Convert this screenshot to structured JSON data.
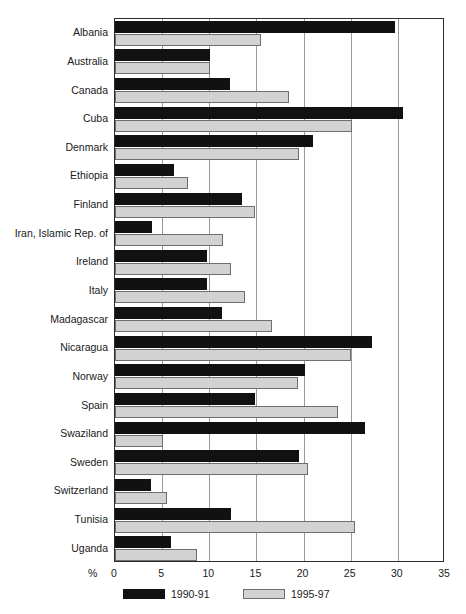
{
  "chart_data": {
    "type": "bar",
    "orientation": "horizontal",
    "title": "",
    "xlabel": "%",
    "ylabel": "",
    "xlim": [
      0,
      35
    ],
    "xticks": [
      0,
      5,
      10,
      15,
      20,
      25,
      30,
      35
    ],
    "grid": true,
    "legend_position": "bottom",
    "categories": [
      "Albania",
      "Australia",
      "Canada",
      "Cuba",
      "Denmark",
      "Ethiopia",
      "Finland",
      "Iran, Islamic Rep. of",
      "Ireland",
      "Italy",
      "Madagascar",
      "Nicaragua",
      "Norway",
      "Spain",
      "Swaziland",
      "Sweden",
      "Switzerland",
      "Tunisia",
      "Uganda"
    ],
    "series": [
      {
        "name": "1990-91",
        "color": "#111111",
        "values": [
          29.7,
          10.1,
          12.2,
          30.5,
          21.0,
          6.3,
          13.5,
          3.9,
          9.8,
          9.8,
          11.3,
          27.3,
          20.2,
          14.8,
          26.5,
          19.5,
          3.8,
          12.3,
          5.9
        ]
      },
      {
        "name": "1995-97",
        "color": "#d2d2d2",
        "values": [
          15.5,
          10.1,
          18.5,
          25.1,
          19.5,
          7.7,
          14.8,
          11.5,
          12.3,
          13.8,
          16.6,
          25.0,
          19.4,
          23.7,
          5.1,
          20.5,
          5.5,
          25.5,
          8.7
        ]
      }
    ]
  },
  "legend": {
    "items": [
      {
        "label": "1990-91"
      },
      {
        "label": "1995-97"
      }
    ]
  },
  "axis": {
    "percent_symbol": "%"
  }
}
